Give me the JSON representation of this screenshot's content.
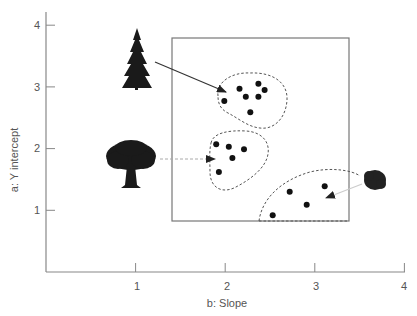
{
  "chart_data": {
    "type": "scatter",
    "title": "",
    "xlabel": "b: Slope",
    "ylabel": "a: Y intercept",
    "xlim": [
      0,
      4
    ],
    "ylim": [
      0,
      4
    ],
    "x_ticks": [
      "1",
      "2",
      "3",
      "4"
    ],
    "y_ticks": [
      "1",
      "2",
      "3",
      "4"
    ],
    "grid": false,
    "legend": "none",
    "series": [
      {
        "name": "Conifer (fir tree) cluster",
        "icon": "conifer-tree-icon",
        "points": [
          [
            1.99,
            2.77
          ],
          [
            2.16,
            2.97
          ],
          [
            2.23,
            2.84
          ],
          [
            2.37,
            3.05
          ],
          [
            2.44,
            2.95
          ],
          [
            2.37,
            2.84
          ],
          [
            2.28,
            2.59
          ]
        ]
      },
      {
        "name": "Broadleaf (oak tree) cluster",
        "icon": "oak-tree-icon",
        "points": [
          [
            1.9,
            2.07
          ],
          [
            2.04,
            2.03
          ],
          [
            2.21,
            1.99
          ],
          [
            2.08,
            1.85
          ],
          [
            1.93,
            1.62
          ]
        ]
      },
      {
        "name": "Shrub cluster",
        "icon": "shrub-icon",
        "points": [
          [
            2.53,
            0.92
          ],
          [
            2.72,
            1.3
          ],
          [
            2.91,
            1.09
          ],
          [
            3.11,
            1.39
          ]
        ]
      }
    ],
    "annotations": [
      {
        "type": "rectangle",
        "x0": 1.39,
        "x1": 3.37,
        "y0": 0.83,
        "y1": 3.8,
        "style": "solid"
      },
      {
        "type": "arrow",
        "from": "conifer-tree-icon",
        "to": [
          1.99,
          2.87
        ],
        "style": "solid dark"
      },
      {
        "type": "arrow",
        "from": "oak-tree-icon",
        "to": [
          1.87,
          1.83
        ],
        "style": "dashed grey"
      },
      {
        "type": "arrow",
        "from": "shrub-icon",
        "to": [
          3.13,
          1.22
        ],
        "style": "light grey"
      }
    ]
  },
  "axes": {
    "x_label": "b: Slope",
    "y_label": "a: Y intercept",
    "x_tick_labels": [
      "1",
      "2",
      "3",
      "4"
    ],
    "y_tick_labels": [
      "1",
      "2",
      "3",
      "4"
    ]
  },
  "colors": {
    "axis": "#777777",
    "point": "#111111",
    "text": "#555555"
  }
}
